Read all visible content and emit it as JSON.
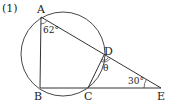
{
  "problem": {
    "number": "(1)"
  },
  "points": {
    "A": {
      "label": "A",
      "x": 41,
      "y": 17
    },
    "B": {
      "label": "B",
      "x": 40,
      "y": 88
    },
    "C": {
      "label": "C",
      "x": 88,
      "y": 88
    },
    "D": {
      "label": "D",
      "x": 104,
      "y": 55
    },
    "E": {
      "label": "E",
      "x": 161,
      "y": 88
    }
  },
  "circle": {
    "cx": 63,
    "cy": 54,
    "r": 42
  },
  "angles": {
    "angle_A": "62°",
    "angle_D": "θ",
    "angle_E": "30°"
  },
  "colors": {
    "stroke": "#333333",
    "text": "#222222"
  }
}
